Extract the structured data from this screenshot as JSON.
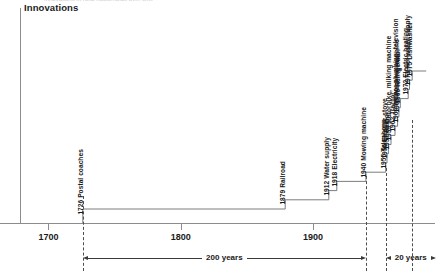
{
  "chart_data": {
    "type": "line",
    "title": "Innovations",
    "subtitle_cut_off": "Innovations in rural households over time",
    "xlabel": "",
    "ylabel": "Innovations",
    "xlim": [
      1680,
      1990
    ],
    "grid": false,
    "legend": "none",
    "x_ticks": [
      {
        "value": 1700,
        "label": "1700"
      },
      {
        "value": 1800,
        "label": "1800"
      },
      {
        "value": 1900,
        "label": "1900"
      }
    ],
    "series": [
      {
        "name": "Cumulative innovations",
        "style": "step",
        "points": [
          {
            "year": 1726,
            "label": "1726 Postal coaches",
            "step": 1
          },
          {
            "year": 1879,
            "label": "1879 Railroad",
            "step": 2
          },
          {
            "year": 1912,
            "label": "1912 Water supply",
            "step": 3
          },
          {
            "year": 1918,
            "label": "1918 Electricity",
            "step": 4
          },
          {
            "year": 1940,
            "label": "1940 Mowing machine",
            "step": 5
          },
          {
            "year": 1955,
            "label": "1955 Telephone",
            "step": 6
          },
          {
            "year": 1956,
            "label": "1956 Electric stove",
            "step": 7
          },
          {
            "year": 1957,
            "label": "1957 Radio",
            "step": 8
          },
          {
            "year": 1959,
            "label": "1959 Motorbike, milking machine",
            "step": 9
          },
          {
            "year": 1962,
            "label": "1962 Tractor",
            "step": 10
          },
          {
            "year": 1964,
            "label": "1964 Indoor plumbing, television",
            "step": 11
          },
          {
            "year": 1965,
            "label": "1965 Washing machine",
            "step": 12
          },
          {
            "year": 1966,
            "label": "1966 Refrigerator",
            "step": 13
          },
          {
            "year": 1972,
            "label": "1972 Electric heating",
            "step": 14
          },
          {
            "year": 1973,
            "label": "1973 Hot water supply",
            "step": 15
          },
          {
            "year": 1975,
            "label": "1975 Dishwasher",
            "step": 16
          }
        ]
      }
    ],
    "annotations": [
      {
        "id": "span-200",
        "label": "200 years",
        "from_year": 1726,
        "to_year": 1940
      },
      {
        "id": "span-20",
        "label": "20 years",
        "from_year": 1955,
        "to_year": 1975
      }
    ],
    "guides": [
      {
        "id": "guide-1726",
        "year": 1726,
        "style": "dashed"
      },
      {
        "id": "guide-1940",
        "year": 1940,
        "style": "dashed"
      },
      {
        "id": "guide-1955",
        "year": 1955,
        "style": "dashed"
      },
      {
        "id": "guide-1975",
        "year": 1975,
        "style": "dashed"
      }
    ],
    "colors": {
      "axis": "#8c8c8c",
      "line": "#6e6e6e",
      "text": "#1a1a1a",
      "dashed": "#4d4d4d",
      "background": "#ffffff"
    }
  }
}
